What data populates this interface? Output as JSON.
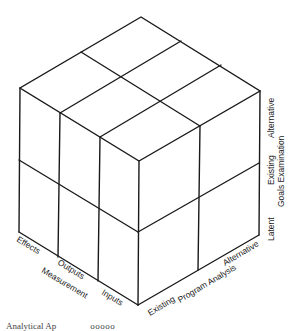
{
  "diagram": {
    "type": "three-dimensional cube matrix",
    "faces": {
      "left": {
        "axis_title": "Measurement",
        "divisions": [
          "Effects",
          "Outputs",
          "Inputs"
        ]
      },
      "right": {
        "axis_title": "Program Analysis",
        "divisions": [
          "Existing",
          "Alternative"
        ]
      },
      "vertical": {
        "axis_title": "Goals Examination",
        "divisions": [
          "Latent",
          "Existing",
          "Alternative"
        ]
      }
    },
    "labels": {
      "effects": "Effects",
      "outputs": "Outputs",
      "measurement": "Measurement",
      "inputs": "Inputs",
      "existing_program": "Existing",
      "program_analysis": "Program Analysis",
      "alternative_program": "Alternative",
      "latent": "Latent",
      "existing_goals": "Existing",
      "goals_examination": "Goals Examination",
      "alternative_goals": "Alternative"
    },
    "caption_partial": "Analytical Ap",
    "caption_partial_right": "ooooo"
  }
}
